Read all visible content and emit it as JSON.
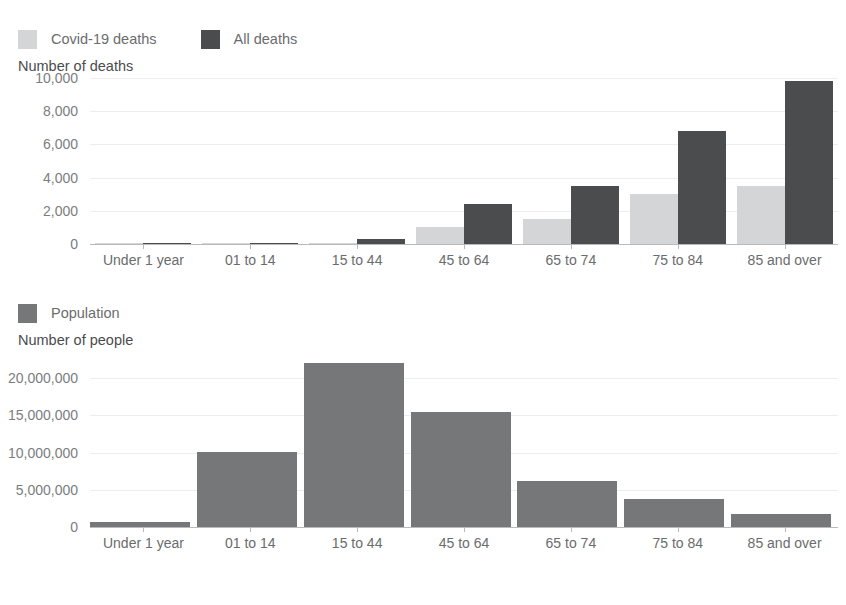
{
  "cropped_title_fragment": "",
  "charts": {
    "deaths": {
      "legend": [
        {
          "label": "Covid-19 deaths",
          "color": "#d4d5d6",
          "swatch_name": "covid-deaths-swatch"
        },
        {
          "label": "All deaths",
          "color": "#4b4c4e",
          "swatch_name": "all-deaths-swatch"
        }
      ],
      "axis_title": "Number of deaths",
      "yticks": [
        "0",
        "2,000",
        "4,000",
        "6,000",
        "8,000",
        "10,000"
      ],
      "xlabels": [
        "Under 1 year",
        "01 to 14",
        "15 to 44",
        "45 to 64",
        "65 to 74",
        "75 to 84",
        "85 and over"
      ]
    },
    "population": {
      "legend": [
        {
          "label": "Population",
          "color": "#767779",
          "swatch_name": "population-swatch"
        }
      ],
      "axis_title": "Number of people",
      "yticks": [
        "0",
        "5,000,000",
        "10,000,000",
        "15,000,000",
        "20,000,000"
      ],
      "xlabels": [
        "Under 1 year",
        "01 to 14",
        "15 to 44",
        "45 to 64",
        "65 to 74",
        "75 to 84",
        "85 and over"
      ]
    }
  },
  "chart_data": [
    {
      "type": "bar",
      "title": "Number of deaths",
      "xlabel": "",
      "ylabel": "Number of deaths",
      "categories": [
        "Under 1 year",
        "01 to 14",
        "15 to 44",
        "45 to 64",
        "65 to 74",
        "75 to 84",
        "85 and over"
      ],
      "series": [
        {
          "name": "Covid-19 deaths",
          "color": "#d4d5d6",
          "values": [
            5,
            10,
            90,
            1000,
            1500,
            3000,
            3500
          ]
        },
        {
          "name": "All deaths",
          "color": "#4b4c4e",
          "values": [
            60,
            70,
            320,
            2400,
            3500,
            6800,
            9800
          ]
        }
      ],
      "ylim": [
        0,
        10000
      ],
      "yticks": [
        0,
        2000,
        4000,
        6000,
        8000,
        10000
      ],
      "grid": true,
      "legend_position": "top-left"
    },
    {
      "type": "bar",
      "title": "Number of people",
      "xlabel": "",
      "ylabel": "Number of people",
      "categories": [
        "Under 1 year",
        "01 to 14",
        "15 to 44",
        "45 to 64",
        "65 to 74",
        "75 to 84",
        "85 and over"
      ],
      "series": [
        {
          "name": "Population",
          "color": "#767779",
          "values": [
            650000,
            10100000,
            22000000,
            15400000,
            6200000,
            3800000,
            1700000
          ]
        }
      ],
      "ylim": [
        0,
        23500000
      ],
      "yticks": [
        0,
        5000000,
        10000000,
        15000000,
        20000000
      ],
      "grid": true,
      "legend_position": "top-left"
    }
  ]
}
